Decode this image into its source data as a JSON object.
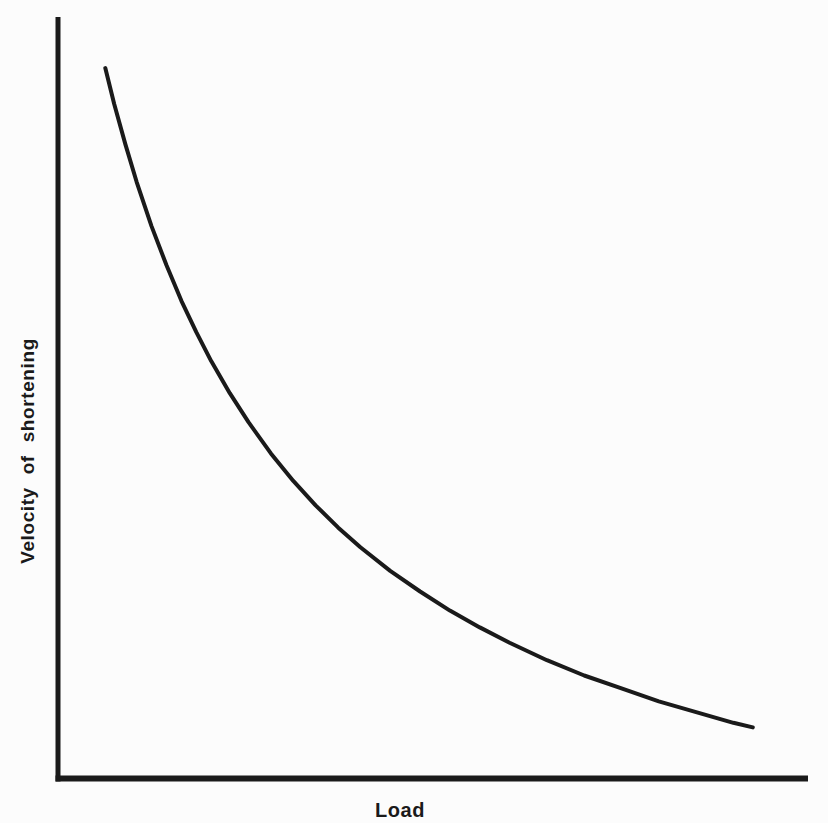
{
  "chart_data": {
    "type": "line",
    "title": "",
    "xlabel": "Load",
    "ylabel": "Velocity of shortening",
    "grid": false,
    "legend": "none",
    "axis_ticks": "none (qualitative axes, no numeric scale)",
    "x_range": [
      0,
      1
    ],
    "y_range": [
      0,
      1
    ],
    "series": [
      {
        "name": "force-velocity curve (hyperbolic decay)",
        "points": [
          [
            0.058,
            0.933
          ],
          [
            0.07,
            0.886
          ],
          [
            0.085,
            0.833
          ],
          [
            0.1,
            0.784
          ],
          [
            0.12,
            0.726
          ],
          [
            0.14,
            0.675
          ],
          [
            0.16,
            0.628
          ],
          [
            0.18,
            0.587
          ],
          [
            0.2,
            0.549
          ],
          [
            0.225,
            0.507
          ],
          [
            0.25,
            0.469
          ],
          [
            0.28,
            0.428
          ],
          [
            0.31,
            0.392
          ],
          [
            0.34,
            0.36
          ],
          [
            0.37,
            0.331
          ],
          [
            0.4,
            0.305
          ],
          [
            0.44,
            0.274
          ],
          [
            0.48,
            0.247
          ],
          [
            0.52,
            0.222
          ],
          [
            0.56,
            0.2
          ],
          [
            0.6,
            0.18
          ],
          [
            0.65,
            0.157
          ],
          [
            0.7,
            0.137
          ],
          [
            0.75,
            0.12
          ],
          [
            0.8,
            0.103
          ],
          [
            0.85,
            0.089
          ],
          [
            0.9,
            0.075
          ],
          [
            0.926,
            0.069
          ]
        ]
      }
    ],
    "colors": {
      "ink": "#1a1a1a",
      "background": "#fcfcfc"
    }
  }
}
